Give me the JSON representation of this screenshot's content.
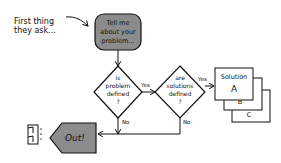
{
  "annotation": {
    "line1": "First thing",
    "line2": "they ask..."
  },
  "start": {
    "line1": "Tell me",
    "line2": "about your",
    "line3": "problem..."
  },
  "decision1": {
    "line1": "is",
    "line2": "problem",
    "line3": "defined",
    "line4": "?"
  },
  "decision2": {
    "line1": "are",
    "line2": "solutions",
    "line3": "defined",
    "line4": "?"
  },
  "labels": {
    "yes1": "Yes",
    "yes2": "Yes",
    "no1": "No",
    "no2": "No"
  },
  "solutions": {
    "title": "Solution",
    "a": "A",
    "b": "B",
    "c": "C"
  },
  "exit": {
    "label": "Out!"
  },
  "colors": {
    "terminal_fill": "#8c8c8c",
    "stroke": "#111111",
    "background": "#ffffff"
  }
}
